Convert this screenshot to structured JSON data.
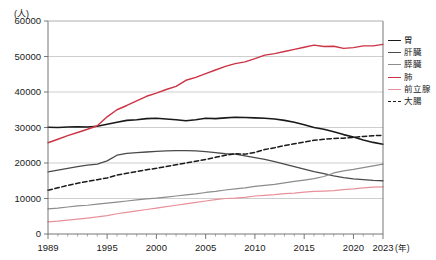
{
  "figure": {
    "title_partial": "",
    "y_unit": "(人)",
    "x_unit": "(年)"
  },
  "legend": {
    "position": "right",
    "items": [
      {
        "label": "胃",
        "color": "#1a1a1a",
        "dash": "solid",
        "width": 1.6
      },
      {
        "label": "肝臓",
        "color": "#4a4a4a",
        "dash": "solid",
        "width": 1.3
      },
      {
        "label": "膵臓",
        "color": "#8c8c8c",
        "dash": "solid",
        "width": 1.2
      },
      {
        "label": "肺",
        "color": "#cc3344",
        "dash": "solid",
        "width": 1.4
      },
      {
        "label": "前立腺",
        "color": "#e8909a",
        "dash": "solid",
        "width": 1.2
      },
      {
        "label": "大腸",
        "color": "#1a1a1a",
        "dash": "dashed",
        "width": 1.5
      }
    ]
  },
  "axes": {
    "y_ticks": [
      "0",
      "10000",
      "20000",
      "30000",
      "40000",
      "50000",
      "60000"
    ],
    "x_ticks_major": [
      "1989",
      "1995",
      "2000",
      "2005",
      "2010",
      "2015",
      "2020",
      "2023"
    ]
  },
  "chart_data": {
    "type": "line",
    "title": "",
    "xlabel": "(年)",
    "ylabel": "(人)",
    "xlim": [
      1989,
      2023
    ],
    "ylim": [
      0,
      60000
    ],
    "grid": true,
    "legend_position": "right",
    "x": [
      1989,
      1990,
      1991,
      1992,
      1993,
      1994,
      1995,
      1996,
      1997,
      1998,
      1999,
      2000,
      2001,
      2002,
      2003,
      2004,
      2005,
      2006,
      2007,
      2008,
      2009,
      2010,
      2011,
      2012,
      2013,
      2014,
      2015,
      2016,
      2017,
      2018,
      2019,
      2020,
      2021,
      2022,
      2023
    ],
    "series": [
      {
        "name": "胃",
        "color": "#1a1a1a",
        "dash": "solid",
        "values": [
          30050,
          30000,
          30150,
          30200,
          30150,
          30350,
          30900,
          31500,
          32000,
          32200,
          32500,
          32600,
          32400,
          32200,
          31900,
          32200,
          32600,
          32500,
          32700,
          32900,
          32800,
          32700,
          32600,
          32400,
          32000,
          31500,
          30800,
          30000,
          29500,
          28800,
          28000,
          27300,
          26500,
          25800,
          25300
        ]
      },
      {
        "name": "肝臓",
        "color": "#4a4a4a",
        "dash": "solid",
        "values": [
          17500,
          18000,
          18500,
          19000,
          19400,
          19700,
          20600,
          22200,
          22700,
          22900,
          23100,
          23300,
          23400,
          23500,
          23500,
          23400,
          23200,
          22900,
          22600,
          22500,
          22000,
          21500,
          21000,
          20400,
          19700,
          19000,
          18300,
          17600,
          17000,
          16400,
          15900,
          15500,
          15300,
          15100,
          15000
        ]
      },
      {
        "name": "膵臓",
        "color": "#8c8c8c",
        "dash": "solid",
        "values": [
          7100,
          7300,
          7600,
          7900,
          8100,
          8400,
          8700,
          9000,
          9300,
          9600,
          9900,
          10100,
          10400,
          10700,
          11000,
          11300,
          11700,
          12000,
          12400,
          12700,
          13000,
          13400,
          13700,
          14000,
          14400,
          14800,
          15200,
          15600,
          16200,
          17200,
          17800,
          18200,
          18700,
          19200,
          19700
        ]
      },
      {
        "name": "肺",
        "color": "#cc3344",
        "dash": "solid",
        "values": [
          25700,
          26700,
          27700,
          28600,
          29500,
          30500,
          33000,
          35000,
          36200,
          37500,
          38800,
          39700,
          40700,
          41600,
          43300,
          44100,
          45200,
          46200,
          47200,
          48000,
          48500,
          49400,
          50400,
          50800,
          51400,
          52000,
          52600,
          53200,
          52800,
          52900,
          52300,
          52500,
          53000,
          53000,
          53400
        ]
      },
      {
        "name": "前立腺",
        "color": "#e8909a",
        "dash": "solid",
        "values": [
          3400,
          3600,
          3900,
          4200,
          4500,
          4800,
          5200,
          5700,
          6100,
          6500,
          6900,
          7300,
          7700,
          8100,
          8500,
          8900,
          9300,
          9700,
          10000,
          10100,
          10300,
          10700,
          10900,
          11100,
          11400,
          11500,
          11800,
          12000,
          12100,
          12200,
          12500,
          12700,
          13000,
          13200,
          13300
        ]
      },
      {
        "name": "大腸",
        "color": "#1a1a1a",
        "dash": "dashed",
        "values": [
          12300,
          13000,
          13700,
          14300,
          14800,
          15300,
          15800,
          16600,
          17100,
          17600,
          18100,
          18500,
          19000,
          19500,
          20000,
          20500,
          21000,
          21600,
          22200,
          22600,
          22500,
          23000,
          23800,
          24300,
          24900,
          25400,
          25900,
          26400,
          26700,
          26900,
          27000,
          27200,
          27500,
          27700,
          27800
        ]
      }
    ]
  }
}
